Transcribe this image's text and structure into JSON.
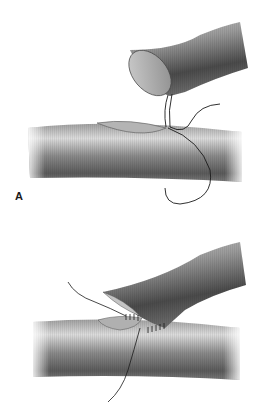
{
  "figure": {
    "panels": [
      {
        "id": "A",
        "label": "A",
        "description": "End of graft vessel with suture loop approaching elliptical arteriotomy on host vessel"
      },
      {
        "id": "B",
        "label": "B",
        "description": "Graft vessel anastomosed end-to-side to host vessel with running suture"
      }
    ]
  },
  "colors": {
    "background": "#ffffff",
    "vessel_light": "#d8d8d8",
    "vessel_mid": "#9a9a9a",
    "vessel_dark": "#555555",
    "suture": "#1a1a1a",
    "opening": "#b8b8b8"
  }
}
